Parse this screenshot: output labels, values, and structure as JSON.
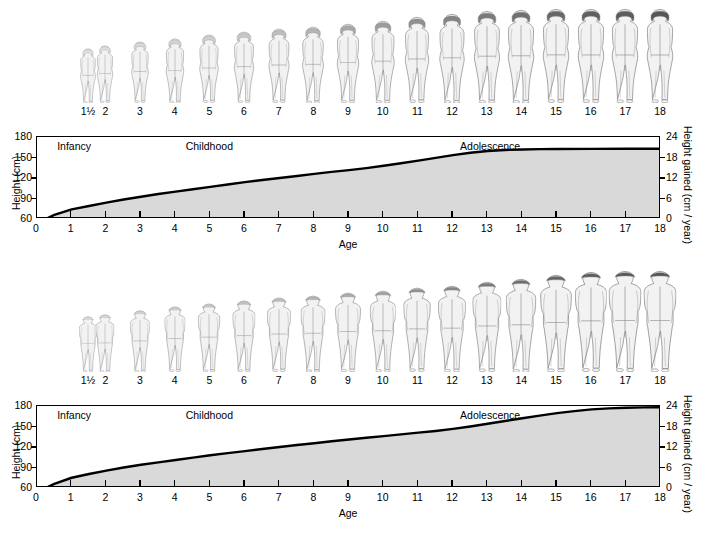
{
  "chart_data": [
    {
      "id": "female",
      "type": "line",
      "title": "",
      "xlabel": "Age",
      "ylabel": "Height (cm)",
      "ylabel_right": "Height gained (cm / year)",
      "xlim": [
        0,
        18
      ],
      "ylim": [
        60,
        180
      ],
      "ylim_right": [
        0,
        24
      ],
      "xticks": [
        0,
        1,
        2,
        3,
        4,
        5,
        6,
        7,
        8,
        9,
        10,
        11,
        12,
        13,
        14,
        15,
        16,
        17,
        18
      ],
      "xticklabels": [
        "0",
        "1",
        "2",
        "3",
        "4",
        "5",
        "6",
        "7",
        "8",
        "9",
        "10",
        "11",
        "12",
        "13",
        "14",
        "15",
        "16",
        "17",
        "18"
      ],
      "yticks": [
        60,
        90,
        120,
        150,
        180
      ],
      "yticklabels": [
        "60",
        "90",
        "120",
        "150",
        "180"
      ],
      "yticks_right": [
        0,
        6,
        12,
        18,
        24
      ],
      "yticklabels_right": [
        "0",
        "6",
        "12",
        "18",
        "24"
      ],
      "grid": false,
      "fill": true,
      "fill_color": "#d9d9d9",
      "line_color": "#000000",
      "x": [
        0,
        0.25,
        0.5,
        1,
        1.5,
        2,
        2.5,
        3,
        3.5,
        4,
        4.5,
        5,
        5.5,
        6,
        6.5,
        7,
        7.5,
        8,
        8.5,
        9,
        9.5,
        10,
        10.5,
        11,
        11.5,
        12,
        12.5,
        13,
        13.5,
        14,
        14.5,
        15,
        16,
        17,
        18
      ],
      "y": [
        60,
        60,
        66,
        74,
        79,
        84,
        88.5,
        92.5,
        96.5,
        100,
        103.5,
        107,
        110.5,
        114,
        117,
        120,
        123,
        126,
        129,
        131.5,
        134.5,
        138,
        141.5,
        145.5,
        149.5,
        153.5,
        157,
        159.5,
        161,
        161.8,
        162.2,
        162.4,
        162.6,
        162.7,
        162.8
      ],
      "stages": [
        {
          "label": "Infancy",
          "x_center": 1.1
        },
        {
          "label": "Childhood",
          "x_center": 5.0
        },
        {
          "label": "Adolescence",
          "x_center": 13.1
        }
      ],
      "figure_ages": [
        "1½",
        "2",
        "3",
        "4",
        "5",
        "6",
        "7",
        "8",
        "9",
        "10",
        "11",
        "12",
        "13",
        "14",
        "15",
        "16",
        "17",
        "18"
      ],
      "figure_sex": "female"
    },
    {
      "id": "male",
      "type": "line",
      "title": "",
      "xlabel": "Age",
      "ylabel": "Height (cm)",
      "ylabel_right": "Height gained (cm / year)",
      "xlim": [
        0,
        18
      ],
      "ylim": [
        60,
        180
      ],
      "ylim_right": [
        0,
        24
      ],
      "xticks": [
        0,
        1,
        2,
        3,
        4,
        5,
        6,
        7,
        8,
        9,
        10,
        11,
        12,
        13,
        14,
        15,
        16,
        17,
        18
      ],
      "xticklabels": [
        "0",
        "1",
        "2",
        "3",
        "4",
        "5",
        "6",
        "7",
        "8",
        "9",
        "10",
        "11",
        "12",
        "13",
        "14",
        "15",
        "16",
        "17",
        "18"
      ],
      "yticks": [
        60,
        90,
        120,
        150,
        180
      ],
      "yticklabels": [
        "60",
        "90",
        "120",
        "150",
        "180"
      ],
      "yticks_right": [
        0,
        6,
        12,
        18,
        24
      ],
      "yticklabels_right": [
        "0",
        "6",
        "12",
        "18",
        "24"
      ],
      "grid": false,
      "fill": true,
      "fill_color": "#d9d9d9",
      "line_color": "#000000",
      "x": [
        0,
        0.25,
        0.5,
        1,
        1.5,
        2,
        2.5,
        3,
        3.5,
        4,
        4.5,
        5,
        5.5,
        6,
        6.5,
        7,
        7.5,
        8,
        8.5,
        9,
        9.5,
        10,
        10.5,
        11,
        11.5,
        12,
        12.5,
        13,
        13.5,
        14,
        14.5,
        15,
        15.5,
        16,
        16.5,
        17,
        17.5,
        18
      ],
      "y": [
        60,
        60,
        66,
        75,
        80.5,
        85.5,
        90,
        94,
        97.5,
        101,
        104.5,
        108,
        111,
        114,
        117,
        120,
        123,
        125.5,
        128.5,
        131,
        133.5,
        136,
        138.5,
        141,
        143.5,
        146.5,
        150,
        154,
        158,
        162,
        166,
        169.5,
        172.5,
        175,
        176.5,
        177.5,
        178,
        178.2
      ],
      "stages": [
        {
          "label": "Infancy",
          "x_center": 1.1
        },
        {
          "label": "Childhood",
          "x_center": 5.0
        },
        {
          "label": "Adolescence",
          "x_center": 13.1
        }
      ],
      "figure_ages": [
        "1½",
        "2",
        "3",
        "4",
        "5",
        "6",
        "7",
        "8",
        "9",
        "10",
        "11",
        "12",
        "13",
        "14",
        "15",
        "16",
        "17",
        "18"
      ],
      "figure_sex": "male"
    }
  ],
  "figures": {
    "female": {
      "heights_cm": [
        79,
        84,
        92.5,
        100,
        107,
        114,
        120,
        126,
        131.5,
        138,
        145.5,
        153.5,
        159.5,
        161.8,
        162.4,
        162.6,
        162.7,
        162.8
      ],
      "hair_shades": [
        "#e2e2e2",
        "#dedede",
        "#d8d8d8",
        "#d4d4d4",
        "#cfcfcf",
        "#c8c8c8",
        "#bfbfbf",
        "#b4b4b4",
        "#a8a8a8",
        "#9c9c9c",
        "#909090",
        "#848484",
        "#7a7a7a",
        "#707070",
        "#686868",
        "#606060",
        "#5c5c5c",
        "#585858"
      ]
    },
    "male": {
      "heights_cm": [
        80.5,
        85.5,
        94,
        101,
        108,
        114,
        120,
        125.5,
        131,
        136,
        141,
        146.5,
        154,
        162,
        169.5,
        175,
        177.5,
        178.2
      ],
      "hair_shades": [
        "#e2e2e2",
        "#dedede",
        "#d8d8d8",
        "#d4d4d4",
        "#cfcfcf",
        "#c8c8c8",
        "#c0c0c0",
        "#b6b6b6",
        "#ababab",
        "#9e9e9e",
        "#929292",
        "#868686",
        "#7a7a7a",
        "#6e6e6e",
        "#646464",
        "#5c5c5c",
        "#585858",
        "#545454"
      ]
    },
    "body_fill": "#f2f2f2",
    "body_stroke": "#8a8a8a"
  },
  "panels": [
    {
      "id": "female",
      "name": "female-growth-panel"
    },
    {
      "id": "male",
      "name": "male-growth-panel"
    }
  ]
}
